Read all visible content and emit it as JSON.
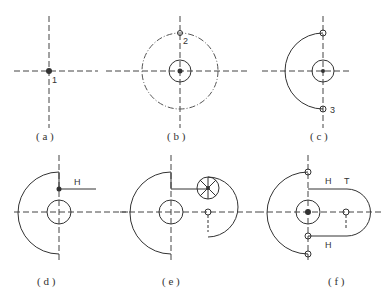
{
  "figure": {
    "panels": [
      {
        "id": "a",
        "caption": "( a )",
        "marks": [
          "1"
        ]
      },
      {
        "id": "b",
        "caption": "( b )",
        "marks": [
          "2"
        ]
      },
      {
        "id": "c",
        "caption": "( c )",
        "marks": [
          "3"
        ]
      },
      {
        "id": "d",
        "caption": "( d )",
        "marks": [
          "H"
        ]
      },
      {
        "id": "e",
        "caption": "( e )",
        "marks": []
      },
      {
        "id": "f",
        "caption": "( f )",
        "marks": [
          "H",
          "T",
          "H"
        ]
      }
    ]
  }
}
